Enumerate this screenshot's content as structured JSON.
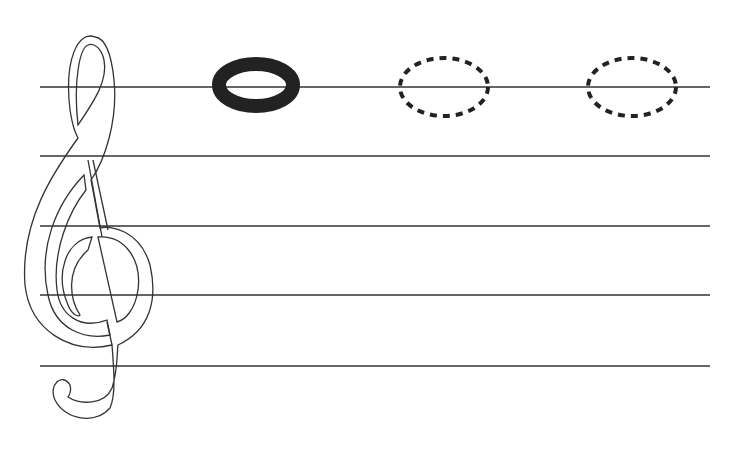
{
  "worksheet": {
    "type": "music-note-tracing",
    "staff": {
      "line_count": 5,
      "line_y": [
        87,
        156,
        226,
        295,
        366
      ],
      "x_start": 40,
      "x_end": 710,
      "line_color": "#333333"
    },
    "clef": {
      "name": "treble-clef",
      "style": "outline"
    },
    "notes": [
      {
        "kind": "whole-note",
        "style": "solid",
        "cx": 256,
        "cy": 85,
        "rx": 44,
        "ry": 28,
        "color": "#222222"
      },
      {
        "kind": "whole-note",
        "style": "dotted-trace",
        "cx": 444,
        "cy": 87,
        "rx": 44,
        "ry": 29,
        "color": "#222222"
      },
      {
        "kind": "whole-note",
        "style": "dotted-trace",
        "cx": 632,
        "cy": 87,
        "rx": 44,
        "ry": 29,
        "color": "#222222"
      }
    ]
  }
}
